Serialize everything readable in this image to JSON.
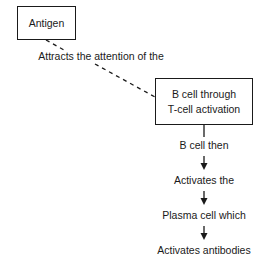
{
  "diagram": {
    "nodes": {
      "antigen": "Antigen",
      "bcell_line1": "B cell through",
      "bcell_line2": "T-cell activation"
    },
    "edge_label": "Attracts the attention of the",
    "steps": [
      "B cell then",
      "Activates the",
      "Plasma cell which",
      "Activates antibodies"
    ],
    "colors": {
      "line": "#1a1a1a",
      "background": "#ffffff"
    }
  }
}
